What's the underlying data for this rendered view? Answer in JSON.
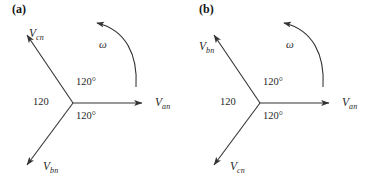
{
  "figure": {
    "background_color": "#ffffff",
    "line_color": "#333333",
    "text_color": "#1f1f1f",
    "width": 373,
    "height": 188
  },
  "panels": [
    {
      "id": "a",
      "label": "(a)",
      "sequence": "abc",
      "phasors": [
        {
          "name": "Van",
          "symbol": "V",
          "subscript": "an",
          "angle_deg": 0,
          "magnitude": 120,
          "direction": "right"
        },
        {
          "name": "Vcn",
          "symbol": "V",
          "subscript": "cn",
          "angle_deg": 120,
          "magnitude": 120,
          "direction": "upper-left"
        },
        {
          "name": "Vbn",
          "symbol": "V",
          "subscript": "bn",
          "angle_deg": -120,
          "magnitude": 120,
          "direction": "lower-left"
        }
      ],
      "angle_labels": {
        "top": "120°",
        "left": "120",
        "bottom": "120°"
      },
      "rotation": {
        "symbol": "ω",
        "direction": "counterclockwise"
      }
    },
    {
      "id": "b",
      "label": "(b)",
      "sequence": "acb",
      "phasors": [
        {
          "name": "Van",
          "symbol": "V",
          "subscript": "an",
          "angle_deg": 0,
          "magnitude": 120,
          "direction": "right"
        },
        {
          "name": "Vbn",
          "symbol": "V",
          "subscript": "bn",
          "angle_deg": 120,
          "magnitude": 120,
          "direction": "upper-left"
        },
        {
          "name": "Vcn",
          "symbol": "V",
          "subscript": "cn",
          "angle_deg": -120,
          "magnitude": 120,
          "direction": "lower-left"
        }
      ],
      "angle_labels": {
        "top": "120°",
        "left": "120",
        "bottom": "120°"
      },
      "rotation": {
        "symbol": "ω",
        "direction": "counterclockwise"
      }
    }
  ]
}
